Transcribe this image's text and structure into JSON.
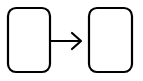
{
  "diagram": {
    "nodes": [
      {
        "id": "left-box",
        "label": ""
      },
      {
        "id": "right-box",
        "label": ""
      }
    ],
    "edges": [
      {
        "from": "left-box",
        "to": "right-box",
        "type": "arrow"
      }
    ],
    "colors": {
      "stroke": "#000000",
      "fill": "#ffffff",
      "background": "#ffffff"
    }
  }
}
